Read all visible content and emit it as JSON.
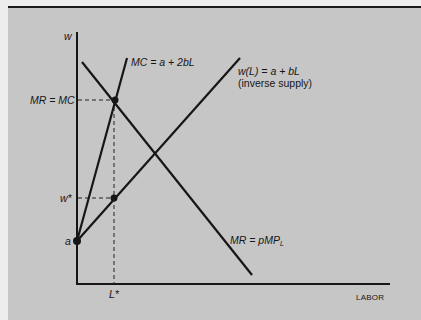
{
  "diagram": {
    "type": "monopsony-labor-market",
    "axes": {
      "y_label": "w",
      "x_label": "LABOR"
    },
    "curves": {
      "marginal_cost": {
        "label": "MC = a + 2bL"
      },
      "inverse_supply": {
        "label_line1": "w(L) = a + bL",
        "label_line2": "(inverse supply)"
      },
      "marginal_revenue": {
        "label_main": "MR = pMP",
        "label_sub": "L"
      }
    },
    "y_ticks": {
      "mr_eq_mc": "MR = MC",
      "w_star": "w*",
      "intercept": "a"
    },
    "x_ticks": {
      "l_star": "L*"
    },
    "colors": {
      "background": "#c6c6c6",
      "page": "#ededed",
      "ink": "#161616"
    }
  }
}
